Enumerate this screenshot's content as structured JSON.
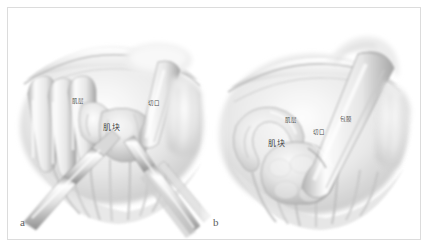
{
  "figure": {
    "kind": "surgical-illustration",
    "style": "grayscale pencil shading",
    "width": 430,
    "height": 249,
    "background_color": "#ffffff",
    "frame_color": "#dcdcdc",
    "ink_color": "#4a4a4a"
  },
  "panels": [
    {
      "letter": "a",
      "description": "Operative field with retracted tissue folds, loop-shaped tubular structures at left, two surgical instruments converging on a central mass, and a grasping instrument at right.",
      "annotations": [
        {
          "text": "肌层",
          "size": "small",
          "x": 72,
          "y": 99
        },
        {
          "text": "肌块",
          "size": "medium",
          "x": 103,
          "y": 124
        },
        {
          "text": "切口",
          "size": "small",
          "x": 148,
          "y": 101
        }
      ],
      "instruments": [
        "grasping-forceps-lower-left",
        "dissector-lower-right",
        "retractor-right"
      ]
    },
    {
      "letter": "b",
      "description": "Closer operative view: lobulated mass elevated at left-center, a curved loop of tissue above it, and a large tubular retractor/instrument crossing from upper right to lower center.",
      "annotations": [
        {
          "text": "肌层",
          "size": "small",
          "x": 285,
          "y": 118
        },
        {
          "text": "切口",
          "size": "small",
          "x": 313,
          "y": 130
        },
        {
          "text": "肌块",
          "size": "medium",
          "x": 268,
          "y": 140
        },
        {
          "text": "包膜",
          "size": "small",
          "x": 340,
          "y": 117
        }
      ],
      "instruments": [
        "tubular-retractor-upper-right",
        "tissue-loop-upper-left"
      ]
    }
  ]
}
